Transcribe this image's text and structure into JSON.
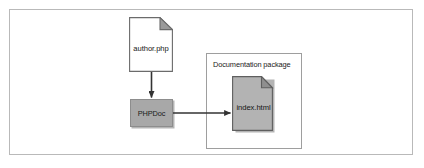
{
  "figure": {
    "type": "flow-diagram",
    "background_color": "#ffffff",
    "frame_border_color": "#b9b9b9"
  },
  "nodes": {
    "source_document": {
      "label": "author.php",
      "icon": "document-page-icon",
      "fill_color": "#ffffff",
      "border_color": "#6b6b6b",
      "fold_color": "#9a9a9a"
    },
    "process": {
      "label": "PHPDoc",
      "fill_color": "#a8a8a8",
      "border_color": "#8d8d8d"
    },
    "output_document": {
      "label": "index.html",
      "icon": "document-page-icon",
      "fill_color": "#b3b3b3",
      "border_color": "#6b6b6b",
      "fold_color": "#8f8f8f"
    }
  },
  "containers": {
    "package": {
      "title": "Documentation package",
      "border_color": "#9e9e9e",
      "fill_color": "#ffffff"
    }
  },
  "connectors": [
    {
      "name": "author-to-phpdoc",
      "direction": "down",
      "from": "author.php",
      "to": "PHPDoc",
      "color": "#333333"
    },
    {
      "name": "phpdoc-to-index",
      "direction": "right",
      "from": "PHPDoc",
      "to": "index.html",
      "color": "#333333"
    }
  ]
}
